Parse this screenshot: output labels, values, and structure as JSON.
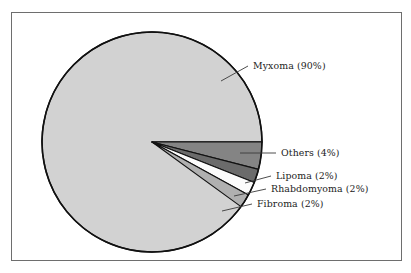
{
  "figure": {
    "background_color": "#ffffff",
    "frame_color": "#6e6e6e",
    "outline_color": "#111111"
  },
  "chart_data": {
    "type": "pie",
    "title": "",
    "subtitle": "",
    "xlabel": "",
    "ylabel": "",
    "legend_position": "none",
    "grid": false,
    "labels_shown_as": "leader-line callouts at right of pie",
    "start_angle_deg": 0,
    "direction": "clockwise",
    "categories": [
      "Myxoma",
      "Others",
      "Lipoma",
      "Rhabdomyoma",
      "Fibroma"
    ],
    "values": [
      90,
      4,
      2,
      2,
      2
    ],
    "units": "percent",
    "total": 100,
    "slices": [
      {
        "name": "Myxoma",
        "value": 90,
        "label": "Myxoma (90%)",
        "color": "#d2d2d2",
        "start_angle_deg": 30.6,
        "end_angle_deg": 360.0
      },
      {
        "name": "Others",
        "value": 4,
        "label": "Others (4%)",
        "color": "#848484",
        "start_angle_deg": 0.0,
        "end_angle_deg": 14.4
      },
      {
        "name": "Lipoma",
        "value": 2,
        "label": "Lipoma (2%)",
        "color": "#6b6b6b",
        "start_angle_deg": 14.4,
        "end_angle_deg": 21.6
      },
      {
        "name": "Rhabdomyoma",
        "value": 2,
        "label": "Rhabdomyoma (2%)",
        "color": "#fbfbfb",
        "start_angle_deg": 21.6,
        "end_angle_deg": 28.8
      },
      {
        "name": "Fibroma",
        "value": 2,
        "label": "Fibroma (2%)",
        "color": "#b0b0b0",
        "start_angle_deg": 28.8,
        "end_angle_deg": 36.0
      }
    ]
  },
  "callouts": {
    "myxoma": "Myxoma (90%)",
    "others": "Others (4%)",
    "lipoma": "Lipoma (2%)",
    "rhabdomyoma": "Rhabdomyoma (2%)",
    "fibroma": "Fibroma (2%)"
  }
}
